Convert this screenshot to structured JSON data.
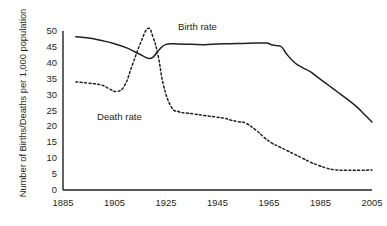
{
  "chart_data": {
    "type": "line",
    "title": "",
    "xlabel": "",
    "ylabel": "Number of Births/Deaths per 1,000 population",
    "xlim": [
      1885,
      2005
    ],
    "ylim": [
      0,
      50
    ],
    "grid": false,
    "legend_position": "inline-annotation",
    "ytick_labels": [
      "50",
      "45",
      "40",
      "35",
      "30",
      "25",
      "20",
      "15",
      "10",
      "5",
      "0"
    ],
    "ytick_values": [
      50,
      45,
      40,
      35,
      30,
      25,
      20,
      15,
      10,
      5,
      0
    ],
    "xtick_labels": [
      "1885",
      "1905",
      "1925",
      "1945",
      "1965",
      "1985",
      "2005"
    ],
    "xtick_values": [
      1885,
      1905,
      1925,
      1945,
      1965,
      1985,
      2005
    ],
    "series": [
      {
        "name": "Birth rate",
        "style": "solid",
        "color": "#231f20",
        "annotation": "Birth rate",
        "x": [
          1890,
          1895,
          1900,
          1905,
          1910,
          1913,
          1916,
          1918,
          1920,
          1922,
          1925,
          1930,
          1935,
          1940,
          1945,
          1950,
          1955,
          1960,
          1964,
          1966,
          1968,
          1970,
          1972,
          1975,
          1978,
          1981,
          1984,
          1987,
          1990,
          1993,
          1996,
          1999,
          2002,
          2005
        ],
        "y": [
          48.2,
          47.8,
          47.0,
          46.0,
          44.6,
          43.4,
          42.2,
          41.4,
          41.8,
          43.8,
          45.8,
          45.9,
          45.8,
          45.7,
          45.9,
          46.0,
          46.1,
          46.2,
          46.2,
          45.7,
          45.4,
          44.9,
          42.6,
          40.0,
          38.5,
          37.2,
          35.4,
          33.6,
          31.8,
          30.0,
          28.2,
          26.2,
          23.8,
          21.4
        ]
      },
      {
        "name": "Death rate",
        "style": "dashed",
        "color": "#231f20",
        "annotation": "Death rate",
        "x": [
          1890,
          1895,
          1900,
          1903,
          1906,
          1909,
          1912,
          1915,
          1918,
          1920,
          1922,
          1924,
          1927,
          1930,
          1933,
          1936,
          1940,
          1944,
          1948,
          1950,
          1953,
          1956,
          1960,
          1963,
          1966,
          1969,
          1972,
          1975,
          1978,
          1981,
          1984,
          1987,
          1990,
          1995,
          2000,
          2005
        ],
        "y": [
          34.0,
          33.6,
          33.0,
          31.8,
          31.0,
          33.0,
          39.5,
          46.0,
          50.8,
          48.0,
          42.0,
          33.0,
          26.2,
          24.6,
          24.2,
          23.9,
          23.4,
          23.0,
          22.5,
          22.0,
          21.5,
          21.0,
          18.8,
          16.6,
          14.8,
          13.6,
          12.4,
          11.2,
          10.0,
          8.8,
          7.8,
          7.0,
          6.4,
          6.2,
          6.2,
          6.3
        ]
      }
    ]
  },
  "axes": {
    "y_axis_name": "y-axis",
    "x_axis_name": "x-axis"
  }
}
